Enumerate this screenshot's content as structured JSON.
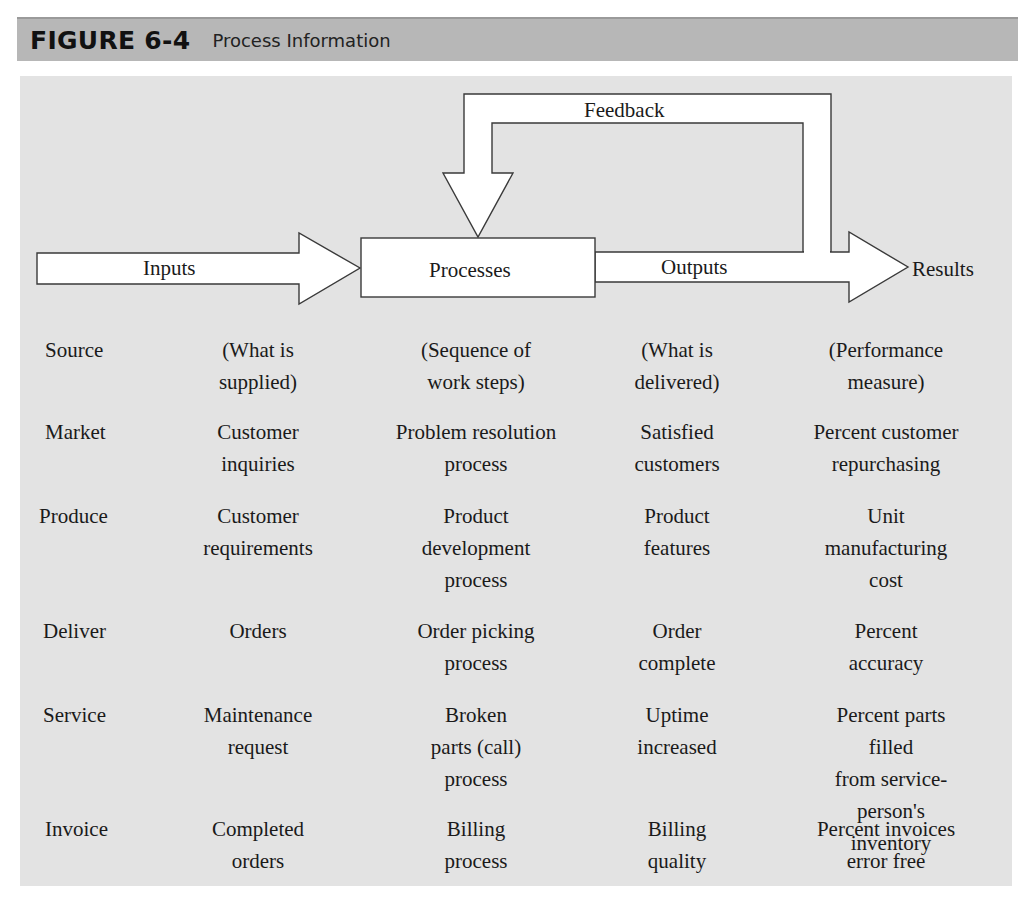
{
  "header": {
    "figure_number": "FIGURE 6-4",
    "title": "Process Information"
  },
  "diagram": {
    "inputs_label": "Inputs",
    "processes_label": "Processes",
    "outputs_label": "Outputs",
    "results_label": "Results",
    "feedback_label": "Feedback"
  },
  "table": {
    "rows": [
      {
        "source": "Source",
        "input": "(What is\nsupplied)",
        "process": "(Sequence of\nwork steps)",
        "output": "(What is\ndelivered)",
        "result": "(Performance\nmeasure)"
      },
      {
        "source": "Market",
        "input": "Customer\ninquiries",
        "process": "Problem resolution\nprocess",
        "output": "Satisfied\ncustomers",
        "result": "Percent customer\nrepurchasing"
      },
      {
        "source": "Produce",
        "input": "Customer\nrequirements",
        "process": "Product\ndevelopment\nprocess",
        "output": "Product\nfeatures",
        "result": "Unit\nmanufacturing\ncost"
      },
      {
        "source": "Deliver",
        "input": "Orders",
        "process": "Order picking\nprocess",
        "output": "Order\ncomplete",
        "result": "Percent\naccuracy"
      },
      {
        "source": "Service",
        "input": "Maintenance\nrequest",
        "process": "Broken\nparts (call)\nprocess",
        "output": "Uptime\nincreased",
        "result": "Percent parts filled\nfrom service-\nperson's inventory"
      },
      {
        "source": "Invoice",
        "input": "Completed\norders",
        "process": "Billing\nprocess",
        "output": "Billing\nquality",
        "result": "Percent invoices\nerror free"
      }
    ]
  },
  "colors": {
    "header_bg": "#b7b7b7",
    "panel_bg": "#e3e3e3",
    "shape_fill": "#ffffff",
    "stroke": "#3a3a3a"
  }
}
